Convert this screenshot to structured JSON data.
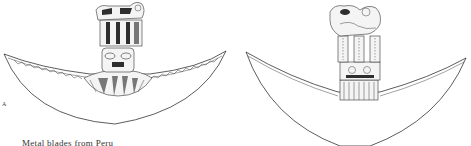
{
  "figure": {
    "panels": [
      {
        "id": "A",
        "label": "A",
        "subject": "crescent-blade-with-figural-handle"
      },
      {
        "id": "B",
        "label": "B",
        "subject": "crescent-blade-with-animal-figure-handle"
      }
    ],
    "caption": "Metal blades from Peru"
  }
}
